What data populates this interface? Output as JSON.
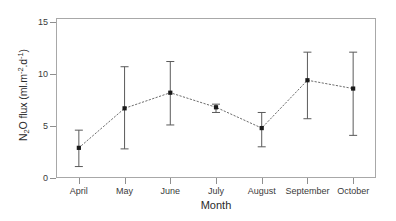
{
  "chart_data": {
    "type": "line",
    "title": "",
    "subtitle": "",
    "xlabel": "Month",
    "ylabel": "N2O flux (ml.m-2.d-1)",
    "ylabel_parts": {
      "lead": "N",
      "sub1": "2",
      "mid": "O flux (ml.m",
      "sup1": "-2",
      "mid2": ".d",
      "sup2": "-1",
      "tail": ")"
    },
    "categories": [
      "April",
      "May",
      "June",
      "July",
      "August",
      "September",
      "October"
    ],
    "values": [
      2.9,
      6.7,
      8.2,
      6.8,
      4.8,
      9.4,
      8.6
    ],
    "error_upper": [
      4.6,
      10.7,
      11.2,
      7.1,
      6.3,
      12.1,
      12.1
    ],
    "error_lower": [
      1.1,
      2.8,
      5.1,
      6.3,
      3.0,
      5.7,
      4.1
    ],
    "ylim": [
      0,
      15.5
    ],
    "yticks": [
      0,
      5,
      10,
      15
    ],
    "ytick_labels": [
      "0",
      "5",
      "10",
      "15"
    ],
    "grid": false,
    "legend": "none",
    "series_style": {
      "line": "dotted",
      "marker": "square",
      "marker_color": "#1a1a1a",
      "line_color": "#6d6d6d",
      "errorbar_color": "#5a5a5a"
    }
  },
  "axes": {
    "frame_color": "#a8a8a8",
    "tick_color": "#8f8f8f",
    "text_color": "#3a3a3a"
  },
  "figure": {
    "background": "#ffffff"
  }
}
